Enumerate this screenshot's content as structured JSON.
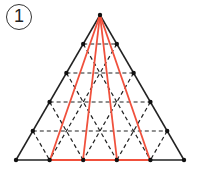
{
  "figure": {
    "label": "1",
    "colors": {
      "outline": "#222222",
      "dashed": "#222222",
      "highlight": "#f0503c",
      "point": "#111111"
    },
    "apex": [
      100,
      15
    ],
    "rows_y": [
      15,
      44,
      73,
      102,
      131,
      160
    ],
    "half_step": 16.8,
    "base_points_x": [
      16,
      50,
      83,
      117,
      150,
      184
    ],
    "highlight_base_x": [
      50,
      83,
      117,
      150
    ]
  }
}
